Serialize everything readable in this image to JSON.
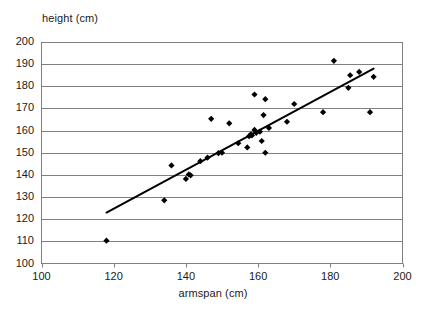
{
  "chart_data": {
    "type": "scatter",
    "title": "",
    "xlabel": "armspan (cm)",
    "ylabel": "height (cm)",
    "xlim": [
      100,
      200
    ],
    "ylim": [
      100,
      200
    ],
    "xticks": [
      100,
      120,
      140,
      160,
      180,
      200
    ],
    "yticks": [
      100,
      110,
      120,
      130,
      140,
      150,
      160,
      170,
      180,
      190,
      200
    ],
    "grid": "horizontal",
    "legend": "none",
    "marker": "diamond",
    "marker_color": "#000000",
    "gridline_color": "#808080",
    "axis_color": "#808080",
    "trendline": {
      "visible": true,
      "color": "#000000",
      "x_start": 118,
      "y_start": 123,
      "x_end": 192,
      "y_end": 188
    },
    "points": [
      {
        "x": 118,
        "y": 110.3
      },
      {
        "x": 134,
        "y": 128.5
      },
      {
        "x": 136,
        "y": 144.3
      },
      {
        "x": 140,
        "y": 138.2
      },
      {
        "x": 140.8,
        "y": 140.2
      },
      {
        "x": 141.3,
        "y": 139.8
      },
      {
        "x": 144,
        "y": 146.2
      },
      {
        "x": 146,
        "y": 147.8
      },
      {
        "x": 147,
        "y": 165.3
      },
      {
        "x": 149,
        "y": 149.8
      },
      {
        "x": 150,
        "y": 150.0
      },
      {
        "x": 152,
        "y": 163.3
      },
      {
        "x": 154.5,
        "y": 154.3
      },
      {
        "x": 157,
        "y": 152.4
      },
      {
        "x": 157.5,
        "y": 157.5
      },
      {
        "x": 158,
        "y": 158.3
      },
      {
        "x": 158.3,
        "y": 157.8
      },
      {
        "x": 159,
        "y": 160.3
      },
      {
        "x": 159,
        "y": 176.3
      },
      {
        "x": 159.5,
        "y": 159.0
      },
      {
        "x": 160.5,
        "y": 159.5
      },
      {
        "x": 161,
        "y": 155.3
      },
      {
        "x": 161.5,
        "y": 167.0
      },
      {
        "x": 162,
        "y": 150.0
      },
      {
        "x": 162,
        "y": 174.2
      },
      {
        "x": 163,
        "y": 161.2
      },
      {
        "x": 168,
        "y": 164.0
      },
      {
        "x": 170,
        "y": 172.0
      },
      {
        "x": 178,
        "y": 168.3
      },
      {
        "x": 181,
        "y": 191.5
      },
      {
        "x": 185,
        "y": 179.3
      },
      {
        "x": 185.5,
        "y": 185.0
      },
      {
        "x": 188,
        "y": 186.5
      },
      {
        "x": 191,
        "y": 168.3
      },
      {
        "x": 192,
        "y": 184.3
      }
    ]
  }
}
